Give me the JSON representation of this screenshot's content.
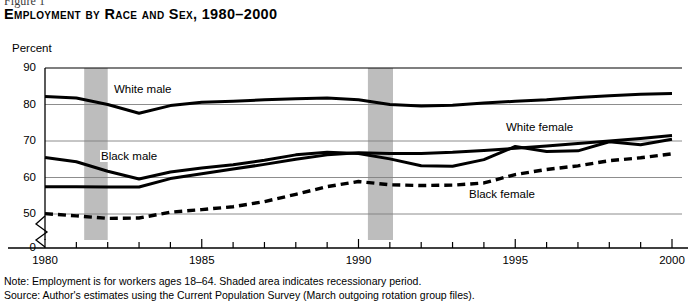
{
  "figure": {
    "label": "Figure 1",
    "title": "Employment by Race and Sex, 1980–2000"
  },
  "notes": {
    "note": "Note: Employment is for workers ages 18–64. Shaded area indicates recessionary period.",
    "source": "Source: Author's estimates using the Current Population Survey (March outgoing rotation group files)."
  },
  "colors": {
    "line": "#000000",
    "gridline": "#808080",
    "axis": "#000000",
    "recession_band": "#bdbdbd",
    "background": "#ffffff"
  },
  "chart_data": {
    "type": "line",
    "title": "Employment by Race and Sex, 1980–2000",
    "xlabel": "",
    "ylabel": "Percent",
    "ylim": [
      45,
      90
    ],
    "yticks": [
      90,
      80,
      70,
      60,
      50,
      0
    ],
    "y_axis_break": true,
    "y_axis_break_note": "Axis broken between 50 and 0",
    "xlim": [
      1980,
      2000
    ],
    "xticks_labeled": [
      1980,
      1985,
      1990,
      1995,
      2000
    ],
    "xticks_minor": [
      1981,
      1982,
      1983,
      1984,
      1986,
      1987,
      1988,
      1989,
      1991,
      1992,
      1993,
      1994,
      1996,
      1997,
      1998,
      1999
    ],
    "grid": "horizontal",
    "legend": "inline-labels",
    "x": [
      1980,
      1981,
      1982,
      1983,
      1984,
      1985,
      1986,
      1987,
      1988,
      1989,
      1990,
      1991,
      1992,
      1993,
      1994,
      1995,
      1996,
      1997,
      1998,
      1999,
      2000
    ],
    "series": [
      {
        "name": "White male",
        "style": "solid",
        "label_x": 1982.3,
        "values": [
          82.2,
          81.8,
          80.0,
          77.6,
          79.7,
          80.6,
          80.9,
          81.3,
          81.6,
          81.8,
          81.3,
          80.0,
          79.6,
          79.8,
          80.4,
          80.9,
          81.3,
          81.9,
          82.4,
          82.8,
          83.0
        ]
      },
      {
        "name": "Black male",
        "style": "solid",
        "label_x": 1981.8,
        "values": [
          65.5,
          64.3,
          61.7,
          59.6,
          61.5,
          62.6,
          63.5,
          64.7,
          66.2,
          66.9,
          66.6,
          65.1,
          63.2,
          63.1,
          64.9,
          68.5,
          67.1,
          67.3,
          69.8,
          69.0,
          70.5
        ]
      },
      {
        "name": "White female",
        "style": "solid",
        "label_x": 1994.7,
        "values": [
          57.5,
          57.5,
          57.4,
          57.4,
          59.7,
          61.0,
          62.3,
          63.6,
          65.0,
          66.2,
          66.8,
          66.6,
          66.6,
          66.9,
          67.4,
          68.0,
          68.6,
          69.3,
          70.0,
          70.7,
          71.5
        ]
      },
      {
        "name": "Black female",
        "style": "dashed",
        "label_x": 1993.5,
        "values": [
          50.1,
          49.5,
          48.8,
          48.9,
          50.5,
          51.2,
          52.0,
          53.4,
          55.4,
          57.5,
          58.9,
          58.0,
          57.8,
          57.9,
          58.5,
          60.8,
          62.2,
          63.2,
          64.6,
          65.4,
          66.5
        ]
      }
    ],
    "recessions": [
      {
        "start": 1981.25,
        "end": 1982.0
      },
      {
        "start": 1990.3,
        "end": 1991.1
      }
    ]
  }
}
